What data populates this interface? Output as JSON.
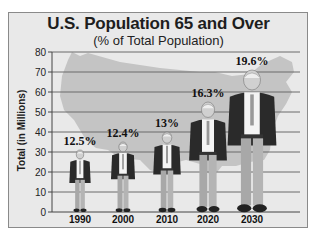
{
  "chart_data": {
    "type": "bar",
    "title": "U.S. Population 65 and Over",
    "subtitle": "(% of Total Population)",
    "xlabel": "",
    "ylabel": "Total (in Millions)",
    "ylim": [
      0,
      80
    ],
    "yticks": [
      0,
      10,
      20,
      30,
      40,
      50,
      60,
      70,
      80
    ],
    "grid": true,
    "legend": "none",
    "bar_style": "pictograph (elderly man figures, height = value)",
    "categories": [
      "1990",
      "2000",
      "2010",
      "2020",
      "2030"
    ],
    "values": [
      31,
      35,
      40,
      55,
      71
    ],
    "annotations": [
      "12.5%",
      "12.4%",
      "13%",
      "16.3%",
      "19.6%"
    ],
    "background": "U.S. map silhouette"
  },
  "colors": {
    "frame_bg": "#e9e9e9",
    "map": "#c4c4c4",
    "grid": "#6a6a6a",
    "text": "#1e1e1e"
  }
}
